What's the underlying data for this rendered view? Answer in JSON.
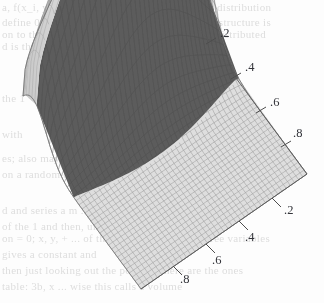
{
  "figure": {
    "kind": "3d-surface-mesh-plot",
    "background_color": "#fdfdfd",
    "ink_color": "#33343a"
  },
  "ghost_text": {
    "note": "faint show-through text from the reverse side of the scanned page",
    "color": "#d8d8d8",
    "lines": [
      {
        "text": "a, f(x_i, y_j) = f(x_i) + f(y_j) is a probability distribution",
        "x": 2,
        "y": 1
      },
      {
        "text": "define 0 < p < 1 .. for the case that a common structure is",
        "x": 2,
        "y": 16
      },
      {
        "text": "on to the conditional distribution is normally distributed",
        "x": 2,
        "y": 28
      },
      {
        "text": "d is the variable in",
        "x": 2,
        "y": 40
      },
      {
        "text": "the 1 + 0.0 (x",
        "x": 2,
        "y": 92
      },
      {
        "text": "with",
        "x": 2,
        "y": 128
      },
      {
        "text": "es; also may be rewritten as a",
        "x": 2,
        "y": 152
      },
      {
        "text": "on a random on",
        "x": 2,
        "y": 168
      },
      {
        "text": "d and series a m ... a m and d(x, y) > 0",
        "x": 2,
        "y": 204
      },
      {
        "text": "of the 1 and then, under the conditional",
        "x": 2,
        "y": 220
      },
      {
        "text": "on = 0; x, y, + ... of the distribution of the three variables",
        "x": 2,
        "y": 232
      },
      {
        "text": "gives a constant and",
        "x": 2,
        "y": 248
      },
      {
        "text": "then just looking out the possible, here are the ones",
        "x": 2,
        "y": 264
      },
      {
        "text": "table: 3b, x ... wise this calls a volume",
        "x": 2,
        "y": 280
      }
    ]
  },
  "chart_data": {
    "type": "surface",
    "title": "",
    "xlabel": "",
    "ylabel": "",
    "zlabel": "",
    "projection": "isometric-oblique",
    "grid": true,
    "legend": false,
    "x_axis": {
      "name": "right-descending-axis",
      "edge": "upper-right",
      "range": [
        0,
        1
      ],
      "tick_values": [
        0.2,
        0.4,
        0.6,
        0.8
      ],
      "tick_labels": [
        ".2",
        ".4",
        ".6",
        ".8"
      ],
      "label_positions": [
        {
          "label": ".2",
          "x": 220,
          "y": 26
        },
        {
          "label": ".4",
          "x": 245,
          "y": 60
        },
        {
          "label": ".6",
          "x": 270,
          "y": 95
        },
        {
          "label": ".8",
          "x": 293,
          "y": 126
        }
      ],
      "tick_marks": [
        {
          "x1": 206,
          "y1": 44,
          "x2": 216,
          "y2": 38
        },
        {
          "x1": 231,
          "y1": 79,
          "x2": 241,
          "y2": 73
        },
        {
          "x1": 256,
          "y1": 113,
          "x2": 266,
          "y2": 107
        },
        {
          "x1": 281,
          "y1": 147,
          "x2": 291,
          "y2": 141
        }
      ]
    },
    "y_axis": {
      "name": "bottom-descending-axis",
      "edge": "lower-right",
      "range": [
        0,
        1
      ],
      "tick_values": [
        0.2,
        0.4,
        0.6,
        0.8
      ],
      "tick_labels": [
        ".2",
        ".4",
        ".6",
        ".8"
      ],
      "label_positions": [
        {
          "label": ".2",
          "x": 284,
          "y": 203
        },
        {
          "label": ".4",
          "x": 245,
          "y": 230
        },
        {
          "label": ".6",
          "x": 212,
          "y": 253
        },
        {
          "label": ".8",
          "x": 180,
          "y": 272
        }
      ],
      "tick_marks": [
        {
          "x1": 272,
          "y1": 198,
          "x2": 281,
          "y2": 207
        },
        {
          "x1": 239,
          "y1": 221,
          "x2": 248,
          "y2": 230
        },
        {
          "x1": 206,
          "y1": 244,
          "x2": 215,
          "y2": 253
        },
        {
          "x1": 173,
          "y1": 266,
          "x2": 182,
          "y2": 275
        }
      ]
    },
    "base_quad": {
      "left": {
        "x": 23,
        "y": 129
      },
      "top": {
        "x": 190,
        "y": 16
      },
      "right": {
        "x": 307,
        "y": 174
      },
      "bottom": {
        "x": 141,
        "y": 289
      }
    },
    "mesh": {
      "nx": 40,
      "ny": 40
    },
    "surface_description": "unimodal ridge: a tall crest rising along the far-left/back edge, falling steeply across a dark-shaded face to a broad flat light-toned plateau filling the near-right half of the domain",
    "shading": {
      "highlight_color": "#f2f2f2",
      "light_face_color": "#b9b9b9",
      "dark_face_color": "#585858",
      "flat_plane_color": "#dcdcdc",
      "mesh_line_color": "#8f8f8f"
    },
    "z_range": [
      0,
      1
    ],
    "peak": {
      "x_screen": 128,
      "y_screen": 14
    }
  }
}
